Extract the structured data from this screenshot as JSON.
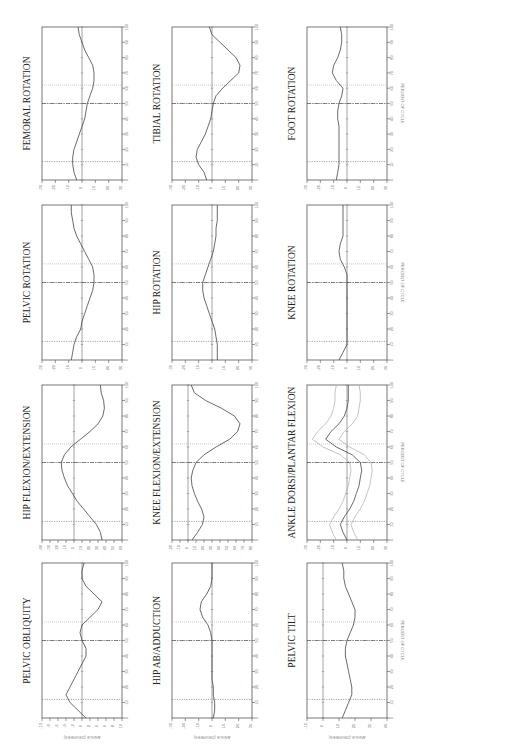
{
  "page": {
    "orientation": "rotated-90-ccw",
    "x_axis_label": "PERCENT OF CYCLE",
    "y_axis_label": "ANGLE (DEGREES)"
  },
  "chart_data": [
    {
      "id": "pelvic-obliquity",
      "type": "line",
      "title": "PELVIC OBLIQUITY",
      "xlabel": "PERCENT OF CYCLE",
      "ylabel": "ANGLE (DEGREES)",
      "xlim": [
        0,
        100
      ],
      "ylim": [
        -10,
        10
      ],
      "x": [
        0,
        5,
        10,
        15,
        20,
        25,
        30,
        35,
        40,
        45,
        50,
        55,
        60,
        65,
        70,
        75,
        80,
        85,
        90,
        95,
        100
      ],
      "values": [
        1,
        -1,
        -3,
        -4,
        -3,
        -2,
        -1,
        0,
        1,
        1,
        0,
        -0.5,
        0,
        2,
        4,
        5,
        3,
        1,
        0,
        0,
        0.5
      ],
      "toe_off": 62,
      "contralateral": [
        12,
        50
      ]
    },
    {
      "id": "hip-flexion-extension",
      "type": "line",
      "title": "HIP FLEXION/EXTENSION",
      "xlabel": "PERCENT OF CYCLE",
      "ylabel": "ANGLE (DEGREES)",
      "xlim": [
        0,
        100
      ],
      "ylim": [
        -40,
        60
      ],
      "x": [
        0,
        5,
        10,
        15,
        20,
        25,
        30,
        35,
        40,
        45,
        50,
        55,
        60,
        65,
        70,
        75,
        80,
        85,
        90,
        95,
        100
      ],
      "values": [
        35,
        33,
        28,
        20,
        12,
        4,
        -2,
        -8,
        -12,
        -15,
        -16,
        -12,
        -4,
        8,
        20,
        30,
        36,
        38,
        37,
        34,
        33
      ],
      "toe_off": 62,
      "contralateral": [
        12,
        50
      ]
    },
    {
      "id": "pelvic-rotation",
      "type": "line",
      "title": "PELVIC ROTATION",
      "xlabel": "PERCENT OF CYCLE",
      "ylabel": "ANGLE (DEGREES)",
      "xlim": [
        0,
        100
      ],
      "ylim": [
        -30,
        30
      ],
      "x": [
        0,
        5,
        10,
        15,
        20,
        25,
        30,
        35,
        40,
        45,
        50,
        55,
        60,
        65,
        70,
        75,
        80,
        85,
        90,
        95,
        100
      ],
      "values": [
        -8,
        -7,
        -6,
        -4,
        -1,
        0,
        2,
        4,
        6,
        8,
        9,
        9,
        8,
        5,
        2,
        -1,
        -4,
        -6,
        -7,
        -8,
        -8
      ],
      "toe_off": 62,
      "contralateral": [
        12,
        50
      ]
    },
    {
      "id": "femoral-rotation",
      "type": "line",
      "title": "FEMORAL ROTATION",
      "xlabel": "PERCENT OF CYCLE",
      "ylabel": "ANGLE (DEGREES)",
      "xlim": [
        0,
        100
      ],
      "ylim": [
        -30,
        30
      ],
      "x": [
        0,
        5,
        10,
        15,
        20,
        25,
        30,
        35,
        40,
        45,
        50,
        55,
        60,
        65,
        70,
        75,
        80,
        85,
        90,
        95,
        100
      ],
      "values": [
        -4,
        -6,
        -7,
        -7,
        -6,
        -4,
        -2,
        0,
        2,
        3,
        4,
        6,
        8,
        9,
        9,
        8,
        5,
        2,
        0,
        -2,
        -3
      ],
      "toe_off": 62,
      "contralateral": [
        12,
        50
      ]
    },
    {
      "id": "hip-ab-adduction",
      "type": "line",
      "title": "HIP AB/ADDUCTION",
      "xlabel": "PERCENT OF CYCLE",
      "ylabel": "ANGLE (DEGREES)",
      "xlim": [
        0,
        100
      ],
      "ylim": [
        -30,
        30
      ],
      "x": [
        0,
        5,
        10,
        15,
        20,
        25,
        30,
        35,
        40,
        45,
        50,
        55,
        60,
        65,
        70,
        75,
        80,
        85,
        90,
        95,
        100
      ],
      "values": [
        1,
        2,
        2,
        1,
        1,
        0,
        0,
        0,
        0,
        0,
        0,
        -1,
        -3,
        -7,
        -9,
        -8,
        -4,
        -1,
        0,
        0,
        0
      ],
      "toe_off": 62,
      "contralateral": [
        12,
        50
      ]
    },
    {
      "id": "knee-flexion-extension",
      "type": "line",
      "title": "KNEE FLEXION/EXTENSION",
      "xlabel": "PERCENT OF CYCLE",
      "ylabel": "ANGLE (DEGREES)",
      "xlim": [
        0,
        100
      ],
      "ylim": [
        -20,
        80
      ],
      "x": [
        0,
        5,
        10,
        15,
        20,
        25,
        30,
        35,
        40,
        45,
        50,
        55,
        60,
        65,
        70,
        75,
        80,
        85,
        90,
        95,
        100
      ],
      "values": [
        5,
        12,
        18,
        20,
        17,
        12,
        8,
        5,
        4,
        6,
        10,
        20,
        35,
        52,
        62,
        65,
        58,
        42,
        22,
        8,
        4
      ],
      "toe_off": 62,
      "contralateral": [
        12,
        50
      ]
    },
    {
      "id": "hip-rotation",
      "type": "line",
      "title": "HIP ROTATION",
      "xlabel": "PERCENT OF CYCLE",
      "ylabel": "ANGLE (DEGREES)",
      "xlim": [
        0,
        100
      ],
      "ylim": [
        -30,
        30
      ],
      "x": [
        0,
        5,
        10,
        15,
        20,
        25,
        30,
        35,
        40,
        45,
        50,
        55,
        60,
        65,
        70,
        75,
        80,
        85,
        90,
        95,
        100
      ],
      "values": [
        4,
        4,
        4,
        3,
        2,
        0,
        -2,
        -4,
        -6,
        -7,
        -7,
        -5,
        -3,
        -1,
        1,
        2,
        3,
        3,
        4,
        4,
        4
      ],
      "toe_off": 62,
      "contralateral": [
        12,
        50
      ]
    },
    {
      "id": "tibial-rotation",
      "type": "line",
      "title": "TIBIAL ROTATION",
      "xlabel": "PERCENT OF CYCLE",
      "ylabel": "ANGLE (DEGREES)",
      "xlim": [
        0,
        100
      ],
      "ylim": [
        -30,
        30
      ],
      "x": [
        0,
        5,
        10,
        15,
        20,
        25,
        30,
        35,
        40,
        45,
        50,
        55,
        60,
        65,
        70,
        75,
        80,
        85,
        90,
        95,
        100
      ],
      "values": [
        -4,
        -6,
        -10,
        -12,
        -11,
        -8,
        -5,
        -3,
        -1,
        0,
        1,
        3,
        8,
        14,
        20,
        21,
        18,
        12,
        6,
        0,
        -2
      ],
      "toe_off": 62,
      "contralateral": [
        12,
        50
      ]
    },
    {
      "id": "pelvic-tilt",
      "type": "line",
      "title": "PELVIC TILT",
      "xlabel": "PERCENT OF CYCLE",
      "ylabel": "ANGLE (DEGREES)",
      "xlim": [
        0,
        100
      ],
      "ylim": [
        -10,
        40
      ],
      "x": [
        0,
        5,
        10,
        15,
        20,
        25,
        30,
        35,
        40,
        45,
        50,
        55,
        60,
        65,
        70,
        75,
        80,
        85,
        90,
        95,
        100
      ],
      "values": [
        12,
        14,
        16,
        18,
        18,
        17,
        16,
        15,
        14,
        14,
        15,
        17,
        19,
        20,
        20,
        18,
        16,
        14,
        13,
        13,
        12
      ],
      "toe_off": 62,
      "contralateral": [
        12,
        50
      ]
    },
    {
      "id": "ankle-dorsi-plantar-flexion",
      "type": "line",
      "title": "ANKLE DORSI/PLANTAR FLEXION",
      "xlabel": "PERCENT OF CYCLE",
      "ylabel": "ANGLE (DEGREES)",
      "xlim": [
        0,
        100
      ],
      "ylim": [
        -30,
        30
      ],
      "x": [
        0,
        5,
        10,
        15,
        20,
        25,
        30,
        35,
        40,
        45,
        50,
        55,
        60,
        65,
        70,
        75,
        80,
        85,
        90,
        95,
        100
      ],
      "values": [
        0,
        -3,
        -5,
        -2,
        2,
        5,
        7,
        9,
        10,
        11,
        10,
        4,
        -8,
        -16,
        -12,
        -6,
        -2,
        0,
        1,
        1,
        1
      ],
      "band_upper": [
        8,
        5,
        3,
        6,
        10,
        13,
        15,
        17,
        18,
        19,
        18,
        13,
        2,
        -6,
        -2,
        4,
        8,
        9,
        10,
        10,
        9
      ],
      "band_lower": [
        -8,
        -11,
        -13,
        -10,
        -6,
        -3,
        -1,
        1,
        2,
        3,
        2,
        -5,
        -18,
        -26,
        -22,
        -16,
        -12,
        -10,
        -9,
        -9,
        -8
      ],
      "toe_off": 62,
      "contralateral": [
        12,
        50
      ]
    },
    {
      "id": "knee-rotation",
      "type": "line",
      "title": "KNEE ROTATION",
      "xlabel": "PERCENT OF CYCLE",
      "ylabel": "ANGLE (DEGREES)",
      "xlim": [
        0,
        100
      ],
      "ylim": [
        -30,
        30
      ],
      "x": [
        0,
        5,
        10,
        15,
        20,
        25,
        30,
        35,
        40,
        45,
        50,
        55,
        60,
        65,
        70,
        75,
        80,
        85,
        90,
        95,
        100
      ],
      "values": [
        -6,
        -3,
        0,
        0,
        0,
        0,
        0,
        0,
        0,
        0,
        0,
        0,
        -2,
        -5,
        -6,
        -5,
        -3,
        -3,
        -3,
        -3,
        -3
      ],
      "toe_off": 62,
      "contralateral": [
        12,
        50
      ]
    },
    {
      "id": "foot-rotation",
      "type": "line",
      "title": "FOOT ROTATION",
      "xlabel": "PERCENT OF CYCLE",
      "ylabel": "ANGLE (DEGREES)",
      "xlim": [
        0,
        100
      ],
      "ylim": [
        -30,
        30
      ],
      "x": [
        0,
        5,
        10,
        15,
        20,
        25,
        30,
        35,
        40,
        45,
        50,
        55,
        60,
        65,
        70,
        75,
        80,
        85,
        90,
        95,
        100
      ],
      "values": [
        -8,
        -7,
        -6,
        -6,
        -6,
        -6,
        -6,
        -6,
        -7,
        -7,
        -6,
        -4,
        -3,
        -8,
        -11,
        -10,
        -7,
        -5,
        -4,
        -4,
        -5
      ],
      "toe_off": 62,
      "contralateral": [
        12,
        50
      ]
    }
  ],
  "layout": {
    "panels": [
      {
        "chart": 0,
        "left": 5,
        "top": 505
      },
      {
        "chart": 1,
        "left": 5,
        "top": 255
      },
      {
        "chart": 2,
        "left": 5,
        "top": 5
      },
      {
        "chart": 3,
        "left": 5,
        "top": -245
      },
      {
        "chart": 4,
        "left": 135,
        "top": 505
      },
      {
        "chart": 5,
        "left": 135,
        "top": 255
      },
      {
        "chart": 6,
        "left": 135,
        "top": 5
      },
      {
        "chart": 7,
        "left": 135,
        "top": -245
      },
      {
        "chart": 8,
        "left": 260,
        "top": 505
      },
      {
        "chart": 9,
        "left": 260,
        "top": 255
      },
      {
        "chart": 10,
        "left": 260,
        "top": 5
      },
      {
        "chart": 11,
        "left": 260,
        "top": -245
      }
    ]
  }
}
